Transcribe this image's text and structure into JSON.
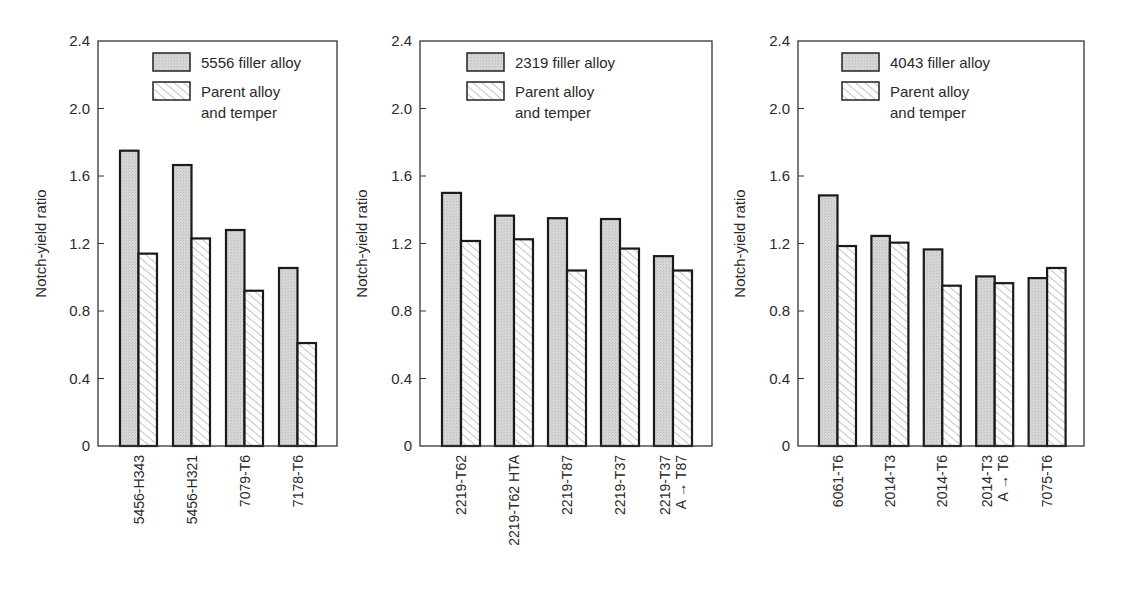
{
  "chart_data": [
    {
      "type": "bar",
      "title": "",
      "xlabel": "",
      "ylabel": "Notch-yield ratio",
      "ylim": [
        0,
        2.4
      ],
      "yticks": [
        "0",
        "0.4",
        "0.8",
        "1.2",
        "1.6",
        "2.0",
        "2.4"
      ],
      "ytick_values": [
        0,
        0.4,
        0.8,
        1.2,
        1.6,
        2.0,
        2.4
      ],
      "grid": false,
      "legend_position": "top-right",
      "categories": [
        [
          "5456-H343"
        ],
        [
          "5456-H321"
        ],
        [
          "7079-T6"
        ],
        [
          "7178-T6"
        ]
      ],
      "series": [
        {
          "name": "5556 filler alloy",
          "legend_lines": [
            "5556 filler alloy"
          ],
          "pattern": "stipple",
          "values": [
            1.75,
            1.665,
            1.28,
            1.055
          ]
        },
        {
          "name": "Parent alloy and temper",
          "legend_lines": [
            "Parent alloy",
            "and temper"
          ],
          "pattern": "hatch",
          "values": [
            1.14,
            1.23,
            0.92,
            0.61
          ]
        }
      ]
    },
    {
      "type": "bar",
      "title": "",
      "xlabel": "",
      "ylabel": "Notch-yield ratio",
      "ylim": [
        0,
        2.4
      ],
      "yticks": [
        "0",
        "0.4",
        "0.8",
        "1.2",
        "1.6",
        "2.0",
        "2.4"
      ],
      "ytick_values": [
        0,
        0.4,
        0.8,
        1.2,
        1.6,
        2.0,
        2.4
      ],
      "grid": false,
      "legend_position": "top-left",
      "categories": [
        [
          "2219-T62"
        ],
        [
          "2219-T62 HTA"
        ],
        [
          "2219-T87"
        ],
        [
          "2219-T37"
        ],
        [
          "2219-T37",
          "A → T87"
        ]
      ],
      "series": [
        {
          "name": "2319 filler alloy",
          "legend_lines": [
            "2319 filler alloy"
          ],
          "pattern": "stipple",
          "values": [
            1.5,
            1.365,
            1.35,
            1.345,
            1.125
          ]
        },
        {
          "name": "Parent alloy and temper",
          "legend_lines": [
            "Parent alloy",
            "and temper"
          ],
          "pattern": "hatch",
          "values": [
            1.215,
            1.225,
            1.04,
            1.17,
            1.04
          ]
        }
      ]
    },
    {
      "type": "bar",
      "title": "",
      "xlabel": "",
      "ylabel": "Notch-yield ratio",
      "ylim": [
        0,
        2.4
      ],
      "yticks": [
        "0",
        "0.4",
        "0.8",
        "1.2",
        "1.6",
        "2.0",
        "2.4"
      ],
      "ytick_values": [
        0,
        0.4,
        0.8,
        1.2,
        1.6,
        2.0,
        2.4
      ],
      "grid": false,
      "legend_position": "top-left",
      "categories": [
        [
          "6061-T6"
        ],
        [
          "2014-T3"
        ],
        [
          "2014-T6"
        ],
        [
          "2014-T3",
          "A → T6"
        ],
        [
          "7075-T6"
        ]
      ],
      "series": [
        {
          "name": "4043 filler alloy",
          "legend_lines": [
            "4043 filler alloy"
          ],
          "pattern": "stipple",
          "values": [
            1.485,
            1.245,
            1.165,
            1.005,
            0.995
          ]
        },
        {
          "name": "Parent alloy and temper",
          "legend_lines": [
            "Parent alloy",
            "and temper"
          ],
          "pattern": "hatch",
          "values": [
            1.185,
            1.205,
            0.95,
            0.965,
            1.055
          ]
        }
      ]
    }
  ]
}
